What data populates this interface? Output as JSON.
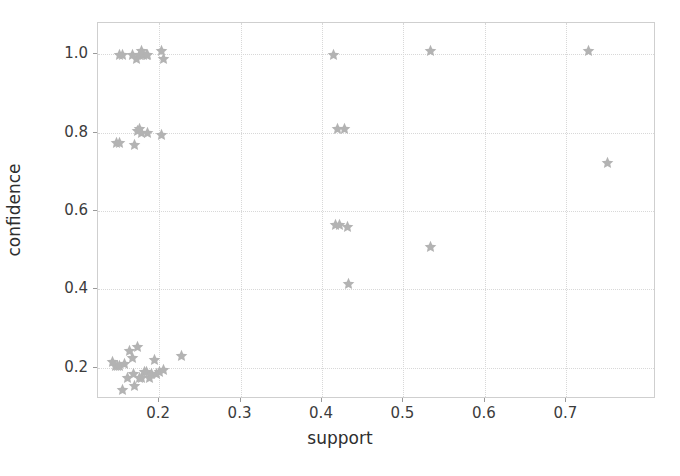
{
  "chart_data": {
    "type": "scatter",
    "title": "",
    "xlabel": "support",
    "ylabel": "confidence",
    "xlim": [
      0.125,
      0.81
    ],
    "ylim": [
      0.12,
      1.08
    ],
    "xticks": [
      0.2,
      0.3,
      0.4,
      0.5,
      0.6,
      0.7
    ],
    "xticklabels": [
      "0.2",
      "0.3",
      "0.4",
      "0.5",
      "0.6",
      "0.7"
    ],
    "yticks": [
      0.2,
      0.4,
      0.6,
      0.8,
      1.0
    ],
    "yticklabels": [
      "0.2",
      "0.4",
      "0.6",
      "0.8",
      "1.0"
    ],
    "grid": true,
    "grid_style": "dotted",
    "legend": null,
    "marker": "star",
    "marker_color": "#b3b3b3",
    "series": [
      {
        "name": "rules",
        "points": [
          [
            0.152,
            1.0
          ],
          [
            0.155,
            1.0
          ],
          [
            0.167,
            1.0
          ],
          [
            0.172,
            0.99
          ],
          [
            0.176,
            1.0
          ],
          [
            0.179,
            1.01
          ],
          [
            0.181,
            1.0
          ],
          [
            0.184,
            1.0
          ],
          [
            0.186,
            1.0
          ],
          [
            0.203,
            1.01
          ],
          [
            0.206,
            0.99
          ],
          [
            0.414,
            1.0
          ],
          [
            0.533,
            1.01
          ],
          [
            0.727,
            1.01
          ],
          [
            0.148,
            0.775
          ],
          [
            0.152,
            0.775
          ],
          [
            0.17,
            0.77
          ],
          [
            0.173,
            0.805
          ],
          [
            0.176,
            0.81
          ],
          [
            0.179,
            0.8
          ],
          [
            0.186,
            0.8
          ],
          [
            0.203,
            0.795
          ],
          [
            0.419,
            0.81
          ],
          [
            0.428,
            0.81
          ],
          [
            0.416,
            0.565
          ],
          [
            0.421,
            0.565
          ],
          [
            0.431,
            0.56
          ],
          [
            0.533,
            0.51
          ],
          [
            0.433,
            0.415
          ],
          [
            0.75,
            0.725
          ],
          [
            0.143,
            0.215
          ],
          [
            0.146,
            0.205
          ],
          [
            0.149,
            0.205
          ],
          [
            0.152,
            0.205
          ],
          [
            0.155,
            0.145
          ],
          [
            0.158,
            0.21
          ],
          [
            0.161,
            0.175
          ],
          [
            0.164,
            0.245
          ],
          [
            0.167,
            0.225
          ],
          [
            0.169,
            0.185
          ],
          [
            0.17,
            0.155
          ],
          [
            0.173,
            0.255
          ],
          [
            0.176,
            0.175
          ],
          [
            0.179,
            0.175
          ],
          [
            0.182,
            0.19
          ],
          [
            0.185,
            0.19
          ],
          [
            0.188,
            0.175
          ],
          [
            0.191,
            0.185
          ],
          [
            0.194,
            0.22
          ],
          [
            0.197,
            0.185
          ],
          [
            0.2,
            0.19
          ],
          [
            0.206,
            0.195
          ],
          [
            0.228,
            0.23
          ]
        ]
      }
    ]
  },
  "axes": {
    "x_label": "support",
    "y_label": "confidence"
  }
}
